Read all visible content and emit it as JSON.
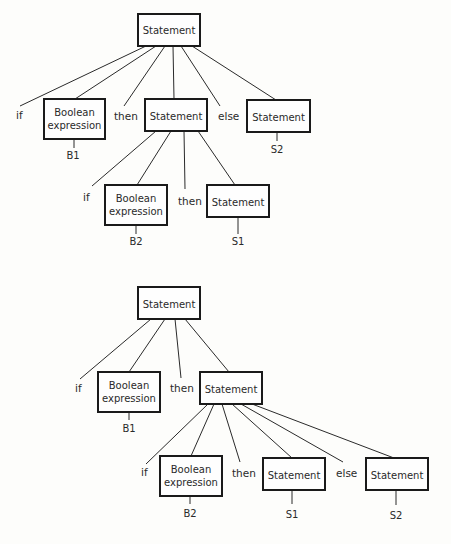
{
  "trees": [
    {
      "id": "tree-1",
      "root": {
        "label": "Statement"
      },
      "children": [
        {
          "type": "terminal",
          "label": "if"
        },
        {
          "type": "box",
          "label": [
            "Boolean",
            "expression"
          ],
          "leaf": "B1"
        },
        {
          "type": "terminal",
          "label": "then"
        },
        {
          "type": "box",
          "label": [
            "Statement"
          ],
          "children": [
            {
              "type": "terminal",
              "label": "if"
            },
            {
              "type": "box",
              "label": [
                "Boolean",
                "expression"
              ],
              "leaf": "B2"
            },
            {
              "type": "terminal",
              "label": "then"
            },
            {
              "type": "box",
              "label": [
                "Statement"
              ],
              "leaf": "S1"
            }
          ]
        },
        {
          "type": "terminal",
          "label": "else"
        },
        {
          "type": "box",
          "label": [
            "Statement"
          ],
          "leaf": "S2"
        }
      ]
    },
    {
      "id": "tree-2",
      "root": {
        "label": "Statement"
      },
      "children": [
        {
          "type": "terminal",
          "label": "if"
        },
        {
          "type": "box",
          "label": [
            "Boolean",
            "expression"
          ],
          "leaf": "B1"
        },
        {
          "type": "terminal",
          "label": "then"
        },
        {
          "type": "box",
          "label": [
            "Statement"
          ],
          "children": [
            {
              "type": "terminal",
              "label": "if"
            },
            {
              "type": "box",
              "label": [
                "Boolean",
                "expression"
              ],
              "leaf": "B2"
            },
            {
              "type": "terminal",
              "label": "then"
            },
            {
              "type": "box",
              "label": [
                "Statement"
              ],
              "leaf": "S1"
            },
            {
              "type": "terminal",
              "label": "else"
            },
            {
              "type": "box",
              "label": [
                "Statement"
              ],
              "leaf": "S2"
            }
          ]
        }
      ]
    }
  ],
  "labels": {
    "statement": "Statement",
    "boolean_line1": "Boolean",
    "boolean_line2": "expression",
    "kw_if": "if",
    "kw_then": "then",
    "kw_else": "else",
    "b1": "B1",
    "b2": "B2",
    "s1": "S1",
    "s2": "S2"
  }
}
